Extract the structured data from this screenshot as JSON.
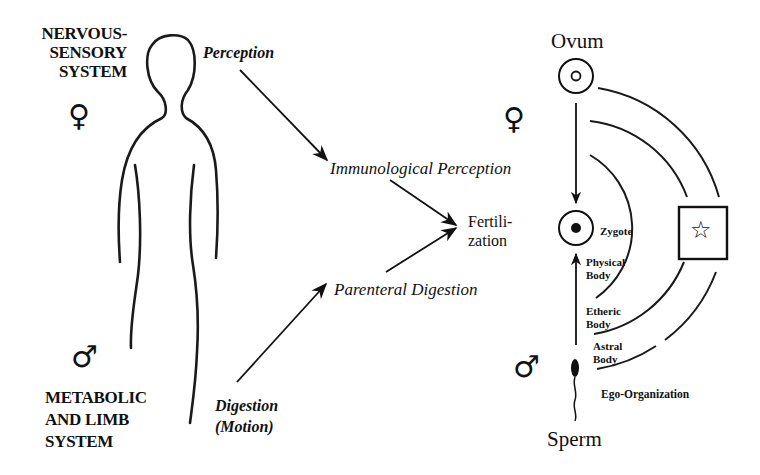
{
  "left": {
    "top_system": {
      "lines": [
        "NERVOUS-",
        "SENSORY",
        "SYSTEM"
      ],
      "symbol": "♀"
    },
    "bottom_system": {
      "lines": [
        "METABOLIC",
        "AND LIMB",
        "SYSTEM"
      ],
      "symbol": "♂"
    }
  },
  "middle": {
    "perception": "Perception",
    "immunological_perception": "Immunological Perception",
    "fertilization": [
      "Fertili-",
      "zation"
    ],
    "parenteral_digestion": "Parenteral Digestion",
    "digestion": [
      "Digestion",
      "(Motion)"
    ]
  },
  "right": {
    "ovum": "Ovum",
    "female_symbol": "♀",
    "male_symbol": "♂",
    "zygote": "Zygote",
    "physical_body": [
      "Physical",
      "Body"
    ],
    "etheric_body": [
      "Etheric",
      "Body"
    ],
    "astral_body": [
      "Astral",
      "Body"
    ],
    "ego_organization": "Ego-Organization",
    "sperm": "Sperm",
    "star_symbol": "☆"
  }
}
